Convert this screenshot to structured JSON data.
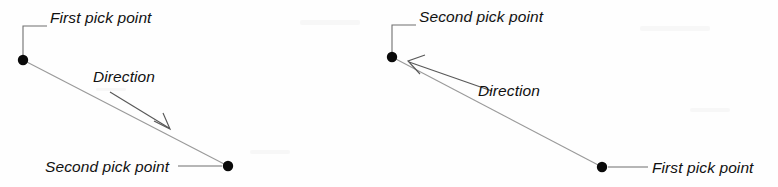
{
  "figure": {
    "background_color": "#fefefe",
    "line_color": "#9a9a9a",
    "text_color": "#111111",
    "dot_color": "#0a0a0a"
  },
  "diagrams": [
    {
      "id": "left",
      "name": "downward-direction-diagram",
      "labels": {
        "first_pick_point": "First pick point",
        "direction": "Direction",
        "second_pick_point": "Second pick point"
      },
      "geometry": {
        "first_point": [
          23,
          60
        ],
        "second_point": [
          228,
          166
        ],
        "direction_arrow_start": [
          110,
          92
        ],
        "direction_arrow_end": [
          169,
          128
        ]
      }
    },
    {
      "id": "right",
      "name": "upward-direction-diagram",
      "labels": {
        "second_pick_point": "Second pick point",
        "direction": "Direction",
        "first_pick_point": "First pick point"
      },
      "geometry": {
        "second_point": [
          392,
          57
        ],
        "first_point": [
          602,
          167
        ],
        "direction_arrow_start": [
          492,
          91
        ],
        "direction_arrow_end": [
          409,
          62
        ]
      }
    }
  ]
}
